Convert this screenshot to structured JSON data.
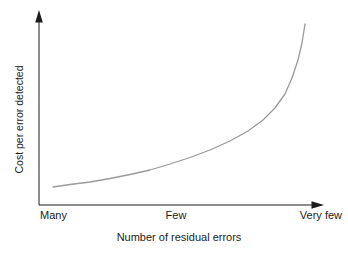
{
  "chart_data": {
    "type": "line",
    "title": "",
    "xlabel": "Number of residual errors",
    "ylabel": "Cost per error detected",
    "x_tick_labels": [
      "Many",
      "Few",
      "Very few"
    ],
    "y_tick_labels": [],
    "grid": false,
    "legend": false,
    "axis_arrows": true,
    "shape_note": "single smooth curve rising slowly from bottom-left, increasing ever more steeply, nearly vertical at the right (cost per error grows exponentially as residual errors get very few)",
    "series": [
      {
        "name": "cost-per-error-curve",
        "color": "#9a9a9a",
        "stroke_width": 1.3,
        "points_px": [
          [
            53,
            187
          ],
          [
            70,
            184.5
          ],
          [
            90,
            182
          ],
          [
            110,
            178.5
          ],
          [
            130,
            174.5
          ],
          [
            150,
            170
          ],
          [
            170,
            164
          ],
          [
            190,
            157.5
          ],
          [
            210,
            150
          ],
          [
            230,
            141
          ],
          [
            248,
            131
          ],
          [
            263,
            120
          ],
          [
            275,
            108
          ],
          [
            285,
            94
          ],
          [
            292,
            78
          ],
          [
            298,
            60
          ],
          [
            302,
            43
          ],
          [
            305,
            24
          ]
        ]
      }
    ]
  },
  "labels": {
    "ylabel": "Cost per error detected",
    "xlabel": "Number of residual errors",
    "tick_many": "Many",
    "tick_few": "Few",
    "tick_very_few": "Very few"
  },
  "colors": {
    "background": "#ffffff",
    "axis": "#1c1c1c",
    "curve": "#9a9a9a",
    "text": "#1c1c1c"
  }
}
